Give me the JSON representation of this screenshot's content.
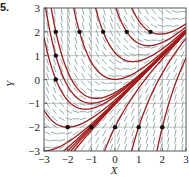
{
  "figure": {
    "label": "5.",
    "xlabel": "X",
    "ylabel": "Y"
  },
  "chart_data": {
    "type": "line",
    "title": "",
    "xlabel": "X",
    "ylabel": "Y",
    "xlim": [
      -3,
      3
    ],
    "ylim": [
      -3,
      3
    ],
    "xticks": [
      -3,
      -2,
      -1,
      0,
      1,
      2,
      3
    ],
    "yticks": [
      -3,
      -2,
      -1,
      0,
      1,
      2,
      3
    ],
    "x_tick_labels": [
      "−3",
      "−2",
      "−1",
      "0",
      "1",
      "2",
      "3"
    ],
    "y_tick_labels": [
      "−3",
      "−2",
      "−1",
      "0",
      "1",
      "2",
      "3"
    ],
    "grid": true,
    "slope_field": {
      "expression": "x - y",
      "color": "#6a8a8e"
    },
    "curve_color": "#a01c1c",
    "initial_points": [
      [
        -2.5,
        2
      ],
      [
        -1.5,
        2
      ],
      [
        -0.5,
        2
      ],
      [
        0.5,
        2
      ],
      [
        1.5,
        2
      ],
      [
        -2.5,
        1
      ],
      [
        -2.5,
        0
      ],
      [
        -2,
        -2
      ],
      [
        -1,
        -2
      ],
      [
        0,
        -2
      ],
      [
        1,
        -2
      ],
      [
        2,
        -2
      ]
    ],
    "point_color": "#111111"
  }
}
